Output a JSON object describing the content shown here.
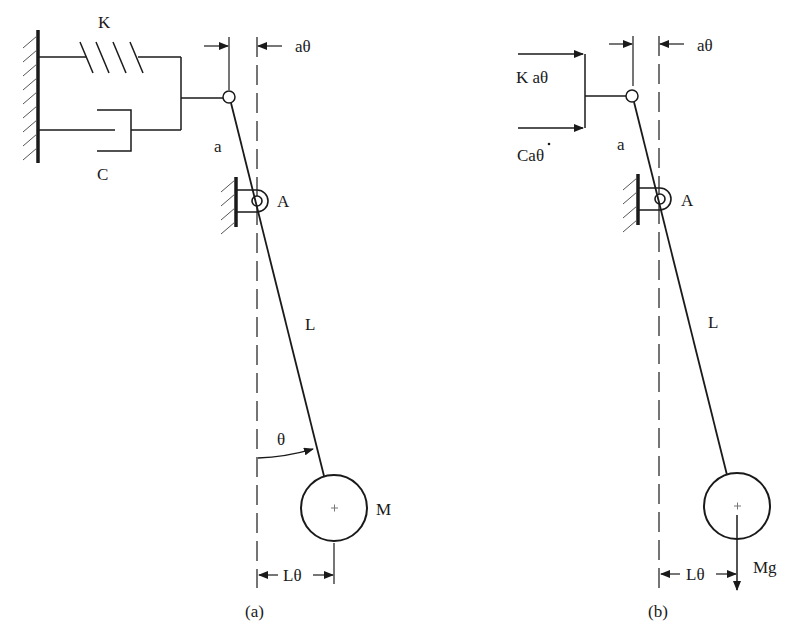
{
  "figure": {
    "panels": [
      {
        "id": "a",
        "caption": "(a)",
        "labels": {
          "spring": "K",
          "damper": "C",
          "short_arm": "a",
          "pivot": "A",
          "long_arm": "L",
          "angle": "θ",
          "mass": "M",
          "top_displacement": "aθ",
          "bottom_displacement": "Lθ"
        }
      },
      {
        "id": "b",
        "caption": "(b)",
        "labels": {
          "spring_force": "K aθ",
          "damper_force": "Caθ",
          "damper_force_dot": "·",
          "short_arm": "a",
          "pivot": "A",
          "long_arm": "L",
          "weight": "Mg",
          "top_displacement": "aθ",
          "bottom_displacement": "Lθ"
        }
      }
    ]
  }
}
